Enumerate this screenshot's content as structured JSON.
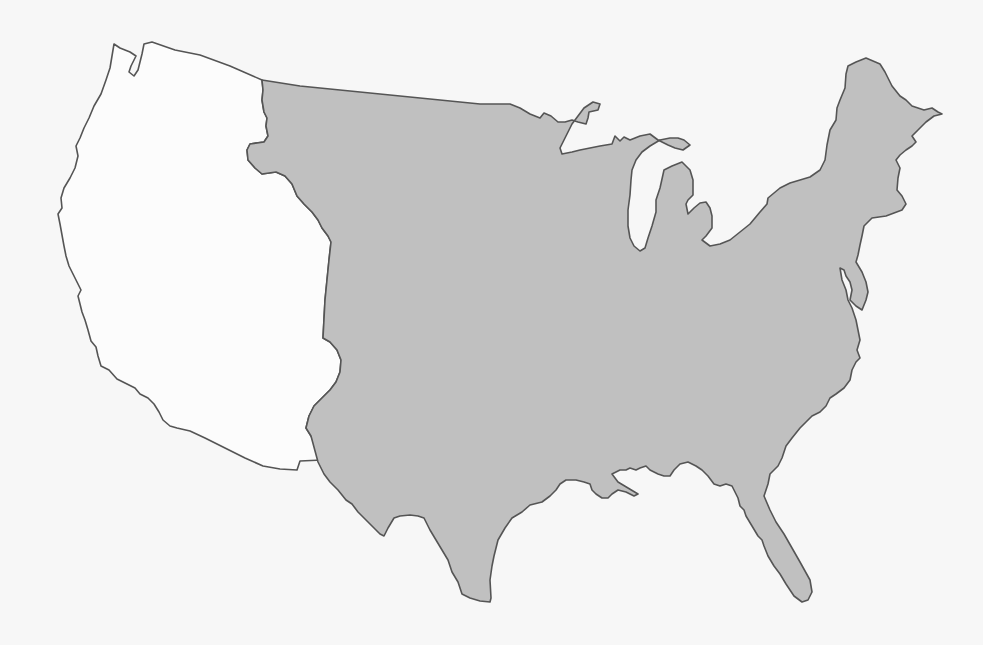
{
  "map": {
    "subject": "Contiguous United States outline",
    "background_color": "#f7f7f7",
    "outline_color": "#555555",
    "regions": [
      {
        "id": "western-region",
        "label": "Western states (unshaded)",
        "fill": "#fcfcfc",
        "shaded": false
      },
      {
        "id": "eastern-region",
        "label": "Central and eastern states (shaded)",
        "fill": "#c0c0c0",
        "shaded": true
      }
    ],
    "lakes": [
      {
        "id": "lake-superior-area",
        "fill": "#fcfcfc"
      },
      {
        "id": "lake-michigan",
        "fill": "#fcfcfc"
      },
      {
        "id": "lake-huron-area",
        "fill": "#fcfcfc"
      }
    ]
  }
}
